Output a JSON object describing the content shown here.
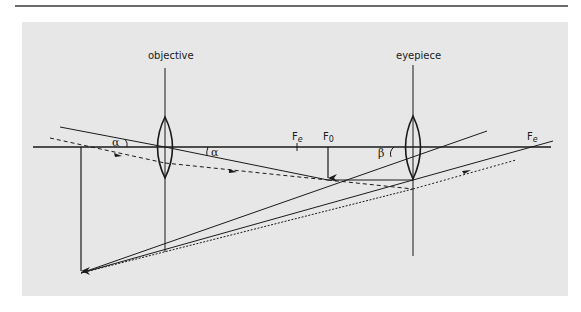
{
  "figure": {
    "labels": {
      "objective": "objective",
      "eyepiece": "eyepiece",
      "focus_eyepiece_left": "F",
      "focus_eyepiece_left_sub": "e",
      "focus_objective": "F",
      "focus_objective_sub": "0",
      "focus_eyepiece_right": "F",
      "focus_eyepiece_right_sub": "e",
      "angle_alpha_left": "α",
      "angle_alpha_right": "α",
      "angle_beta": "β"
    },
    "colors": {
      "background": "#ffffff",
      "panel": "#e7e7e7",
      "ink": "#1a1a1a",
      "rule": "#6a6a6a"
    },
    "elements": [
      "optical axis",
      "objective lens",
      "eyepiece lens",
      "final image arrow",
      "intermediate image arrow",
      "solid rays",
      "dashed rays with direction arrows"
    ]
  }
}
